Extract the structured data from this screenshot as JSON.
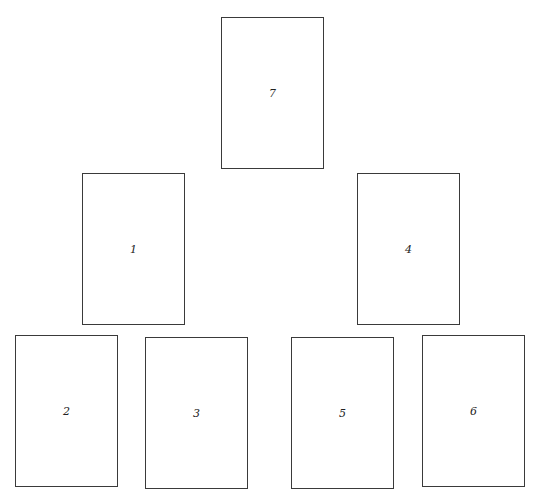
{
  "diagram": {
    "type": "card-layout",
    "cards": [
      {
        "label": "7",
        "x": 221,
        "y": 17
      },
      {
        "label": "1",
        "x": 82,
        "y": 173
      },
      {
        "label": "4",
        "x": 357,
        "y": 173
      },
      {
        "label": "2",
        "x": 15,
        "y": 335
      },
      {
        "label": "3",
        "x": 145,
        "y": 337
      },
      {
        "label": "5",
        "x": 291,
        "y": 337
      },
      {
        "label": "6",
        "x": 422,
        "y": 335
      }
    ]
  }
}
